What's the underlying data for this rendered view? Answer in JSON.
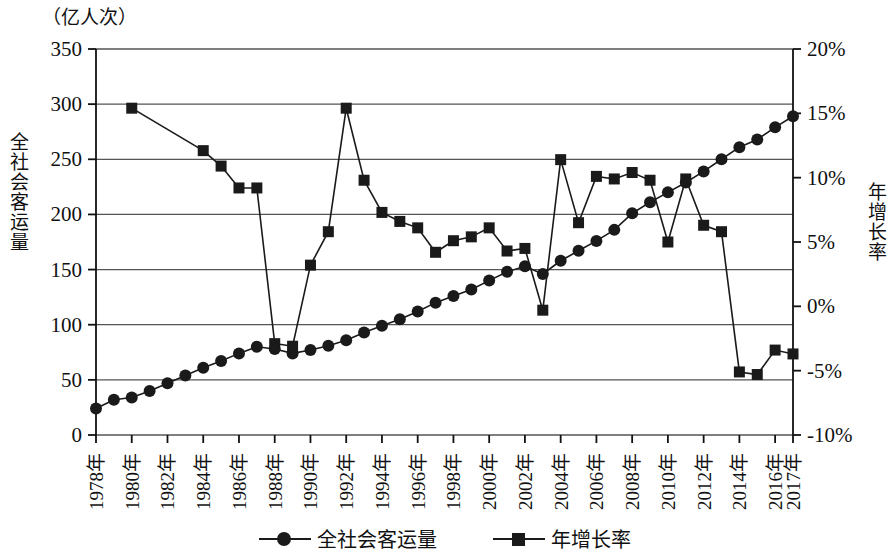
{
  "unit_label": "（亿人次）",
  "axis_titles": {
    "left": "全社会客运量",
    "right": "年增长率"
  },
  "legend": {
    "items": [
      {
        "label": "全社会客运量",
        "marker": "circle-marker",
        "color": "#1a1a1a"
      },
      {
        "label": "年增长率",
        "marker": "square-marker",
        "color": "#1a1a1a"
      }
    ]
  },
  "colors": {
    "series": "#1a1a1a",
    "grid": "#555555",
    "axis": "#111111",
    "background": "#ffffff"
  },
  "chart_data": {
    "type": "line",
    "title": "",
    "xlabel": "",
    "ylabel": "全社会客运量",
    "y2label": "年增长率",
    "unit": "亿人次",
    "grid": true,
    "legend_position": "bottom",
    "ylim": [
      0,
      350
    ],
    "y2lim": [
      -10,
      20
    ],
    "yticks": [
      0,
      50,
      100,
      150,
      200,
      250,
      300,
      350
    ],
    "ytick_labels": [
      "0",
      "50",
      "100",
      "150",
      "200",
      "250",
      "300",
      "350"
    ],
    "y2ticks": [
      -10,
      -5,
      0,
      5,
      10,
      15,
      20
    ],
    "y2tick_labels": [
      "-10%",
      "-5%",
      "0%",
      "5%",
      "10%",
      "15%",
      "20%"
    ],
    "x": [
      1978,
      1979,
      1980,
      1981,
      1982,
      1983,
      1984,
      1985,
      1986,
      1987,
      1988,
      1989,
      1990,
      1991,
      1992,
      1993,
      1994,
      1995,
      1996,
      1997,
      1998,
      1999,
      2000,
      2001,
      2002,
      2003,
      2004,
      2005,
      2006,
      2007,
      2008,
      2009,
      2010,
      2011,
      2012,
      2013,
      2014,
      2015,
      2016,
      2017
    ],
    "xtick_labels": [
      "1978年",
      "1980年",
      "1982年",
      "1984年",
      "1986年",
      "1988年",
      "1990年",
      "1992年",
      "1994年",
      "1996年",
      "1998年",
      "2000年",
      "2002年",
      "2004年",
      "2006年",
      "2008年",
      "2010年",
      "2012年",
      "2014年",
      "2016年",
      "2017年"
    ],
    "xticks": [
      1978,
      1980,
      1982,
      1984,
      1986,
      1988,
      1990,
      1992,
      1994,
      1996,
      1998,
      2000,
      2002,
      2004,
      2006,
      2008,
      2010,
      2012,
      2014,
      2016,
      2017
    ],
    "series": [
      {
        "name": "全社会客运量",
        "axis": "left",
        "marker": "circle",
        "values": [
          24,
          32,
          34,
          40,
          47,
          54,
          61,
          67,
          74,
          80,
          78,
          74,
          77,
          81,
          86,
          93,
          99,
          105,
          112,
          120,
          126,
          132,
          140,
          148,
          153,
          146,
          158,
          167,
          176,
          186,
          201,
          211,
          220,
          229,
          239,
          250,
          261,
          268,
          279,
          289
        ],
        "values_visible": [
          24,
          32,
          34,
          40,
          47,
          54,
          61,
          67,
          74,
          80,
          78,
          74,
          77,
          81,
          86,
          93,
          99,
          105,
          112,
          120,
          126,
          132,
          140,
          148,
          153,
          146,
          158,
          167,
          176,
          186,
          201,
          211,
          220,
          229,
          239,
          250,
          261,
          268,
          279,
          289
        ]
      },
      {
        "name": "年增长率",
        "axis": "right",
        "marker": "square",
        "values": [
          null,
          null,
          15.4,
          null,
          null,
          null,
          12.1,
          10.9,
          9.2,
          9.2,
          -2.9,
          -3.1,
          3.2,
          5.8,
          15.4,
          9.8,
          7.3,
          6.6,
          6.1,
          4.2,
          5.1,
          5.4,
          6.1,
          4.3,
          4.5,
          -0.3,
          11.4,
          6.5,
          10.1,
          9.9,
          10.4,
          9.8,
          5.0,
          9.9,
          6.3,
          5.8,
          -5.1,
          -5.3,
          -3.4,
          -3.7
        ]
      }
    ],
    "annotations": []
  },
  "series_points": {
    "passenger": [
      {
        "year": 1978,
        "value": 24
      },
      {
        "year": 1979,
        "value": 32
      },
      {
        "year": 1980,
        "value": 34
      },
      {
        "year": 1981,
        "value": 40
      },
      {
        "year": 1982,
        "value": 47
      },
      {
        "year": 1983,
        "value": 54
      },
      {
        "year": 1984,
        "value": 61
      },
      {
        "year": 1985,
        "value": 67
      },
      {
        "year": 1986,
        "value": 74
      },
      {
        "year": 1987,
        "value": 80
      },
      {
        "year": 1988,
        "value": 78
      },
      {
        "year": 1989,
        "value": 74
      },
      {
        "year": 1990,
        "value": 77
      },
      {
        "year": 1991,
        "value": 81
      },
      {
        "year": 1992,
        "value": 86
      },
      {
        "year": 1993,
        "value": 93
      },
      {
        "year": 1994,
        "value": 99
      },
      {
        "year": 1995,
        "value": 105
      },
      {
        "year": 1996,
        "value": 112
      },
      {
        "year": 1997,
        "value": 120
      },
      {
        "year": 1998,
        "value": 126
      },
      {
        "year": 1999,
        "value": 132
      },
      {
        "year": 2000,
        "value": 140
      },
      {
        "year": 2001,
        "value": 148
      },
      {
        "year": 2002,
        "value": 153
      },
      {
        "year": 2003,
        "value": 146
      },
      {
        "year": 2004,
        "value": 158
      },
      {
        "year": 2005,
        "value": 167
      },
      {
        "year": 2006,
        "value": 176
      },
      {
        "year": 2007,
        "value": 186
      },
      {
        "year": 2008,
        "value": 201
      },
      {
        "year": 2009,
        "value": 211
      },
      {
        "year": 2010,
        "value": 220
      },
      {
        "year": 2011,
        "value": 229
      },
      {
        "year": 2012,
        "value": 239
      },
      {
        "year": 2013,
        "value": 250
      },
      {
        "year": 2014,
        "value": 261
      },
      {
        "year": 2015,
        "value": 268
      },
      {
        "year": 2016,
        "value": 279
      },
      {
        "year": 2017,
        "value": 289
      }
    ],
    "growth": [
      {
        "year": 1980,
        "value": 15.4
      },
      {
        "year": 1984,
        "value": 12.1
      },
      {
        "year": 1985,
        "value": 10.9
      },
      {
        "year": 1986,
        "value": 9.2
      },
      {
        "year": 1987,
        "value": 9.2
      },
      {
        "year": 1988,
        "value": -2.9
      },
      {
        "year": 1989,
        "value": -3.1
      },
      {
        "year": 1990,
        "value": 3.2
      },
      {
        "year": 1991,
        "value": 5.8
      },
      {
        "year": 1992,
        "value": 15.4
      },
      {
        "year": 1993,
        "value": 9.8
      },
      {
        "year": 1994,
        "value": 7.3
      },
      {
        "year": 1995,
        "value": 6.6
      },
      {
        "year": 1996,
        "value": 6.1
      },
      {
        "year": 1997,
        "value": 4.2
      },
      {
        "year": 1998,
        "value": 5.1
      },
      {
        "year": 1999,
        "value": 5.4
      },
      {
        "year": 2000,
        "value": 6.1
      },
      {
        "year": 2001,
        "value": 4.3
      },
      {
        "year": 2002,
        "value": 4.5
      },
      {
        "year": 2003,
        "value": -0.3
      },
      {
        "year": 2004,
        "value": 11.4
      },
      {
        "year": 2005,
        "value": 6.5
      },
      {
        "year": 2006,
        "value": 10.1
      },
      {
        "year": 2007,
        "value": 9.9
      },
      {
        "year": 2008,
        "value": 10.4
      },
      {
        "year": 2009,
        "value": 9.8
      },
      {
        "year": 2010,
        "value": 5.0
      },
      {
        "year": 2011,
        "value": 9.9
      },
      {
        "year": 2012,
        "value": 6.3
      },
      {
        "year": 2013,
        "value": 5.8
      },
      {
        "year": 2014,
        "value": -5.1
      },
      {
        "year": 2015,
        "value": -5.3
      },
      {
        "year": 2016,
        "value": -3.4
      },
      {
        "year": 2017,
        "value": -3.7
      }
    ]
  }
}
